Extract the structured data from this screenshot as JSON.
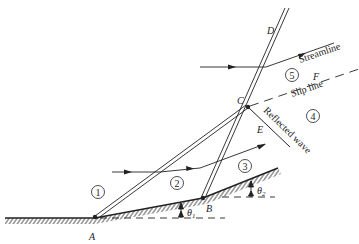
{
  "diagram": {
    "title": "",
    "points": {
      "A": "A",
      "B": "B",
      "C": "C",
      "D": "D",
      "E": "E",
      "F": "F"
    },
    "regions": [
      "1",
      "2",
      "3",
      "4",
      "5"
    ],
    "labels": {
      "streamline": "Streamline",
      "slip_line": "Slip line",
      "reflected_wave": "Reflected wave",
      "theta1": "θ",
      "theta1_sub": "1",
      "theta2": "θ",
      "theta2_sub": "2"
    },
    "colors": {
      "line": "#222222",
      "background": "#ffffff"
    }
  }
}
